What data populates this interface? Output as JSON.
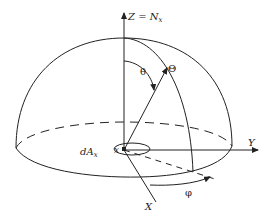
{
  "diagram": {
    "labels": {
      "z_axis": "Z = N",
      "z_axis_sub": "x",
      "y_axis": "Y",
      "x_axis": "X",
      "theta_angle": "θ",
      "direction_point": "Θ",
      "phi_angle": "φ",
      "area_element": "dA",
      "area_element_sub": "x",
      "origin_point": "x"
    },
    "colors": {
      "stroke": "#222222",
      "background": "#ffffff"
    }
  }
}
